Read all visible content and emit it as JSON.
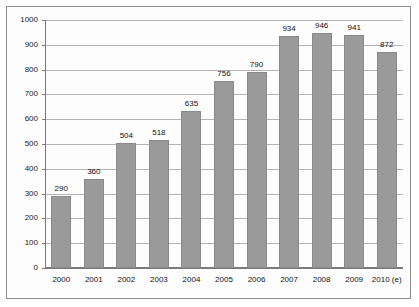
{
  "chart_data": {
    "type": "bar",
    "title": "",
    "subtitle": "",
    "xlabel": "",
    "ylabel": "",
    "categories": [
      "2000",
      "2001",
      "2002",
      "2003",
      "2004",
      "2005",
      "2006",
      "2007",
      "2008",
      "2009",
      "2010 (e)"
    ],
    "values": [
      290,
      360,
      504,
      518,
      635,
      756,
      790,
      934,
      946,
      941,
      872
    ],
    "data_labels": [
      "290",
      "360",
      "504",
      "518",
      "635",
      "756",
      "790",
      "934",
      "946",
      "941",
      "872"
    ],
    "ylim": [
      0,
      1000
    ],
    "ytick_step": 100,
    "ytick_labels": [
      "0",
      "100",
      "200",
      "300",
      "400",
      "500",
      "600",
      "700",
      "800",
      "900",
      "1000"
    ],
    "grid": true,
    "legend": false,
    "legend_position": "none",
    "series": [
      {
        "name": "",
        "values": [
          290,
          360,
          504,
          518,
          635,
          756,
          790,
          934,
          946,
          941,
          872
        ]
      }
    ],
    "colors": {
      "bar_fill": "#9a9a9a",
      "bar_border": "#8a8a8a",
      "gridline": "#b3b3b3",
      "axis": "#7a7a7a",
      "text": "#111111",
      "background": "#fdfdfd",
      "frame": "#8d8d8d"
    },
    "annotations": []
  }
}
